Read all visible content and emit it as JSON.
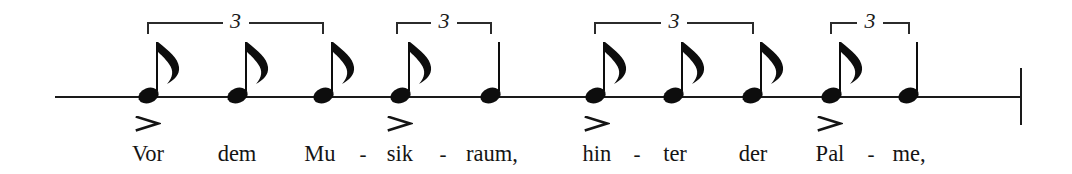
{
  "score": {
    "notation_type": "rhythm-staff",
    "staff": {
      "line_y": 96,
      "line_x_start": 55,
      "line_x_end": 1021,
      "color": "#1a1a1a"
    },
    "barline": {
      "name": "final-barline",
      "x": 1020,
      "y_top": 68,
      "y_bottom": 125
    },
    "tuplets": [
      {
        "number": "3",
        "x_left": 147,
        "x_right": 324,
        "y": 22
      },
      {
        "number": "3",
        "x_left": 396,
        "x_right": 492,
        "y": 22
      },
      {
        "number": "3",
        "x_left": 594,
        "x_right": 754,
        "y": 22
      },
      {
        "number": "3",
        "x_left": 830,
        "x_right": 910,
        "y": 22
      }
    ],
    "notes": [
      {
        "id": "n1",
        "x": 148,
        "duration": "eighth",
        "flag": true,
        "accent": true,
        "syllable": "Vor"
      },
      {
        "id": "n2",
        "x": 237,
        "duration": "eighth",
        "flag": true,
        "accent": false,
        "syllable": "dem"
      },
      {
        "id": "n3",
        "x": 323,
        "duration": "eighth",
        "flag": true,
        "accent": false,
        "syllable": "Mu"
      },
      {
        "id": "n4",
        "x": 400,
        "duration": "eighth",
        "flag": true,
        "accent": true,
        "syllable": "sik"
      },
      {
        "id": "n5",
        "x": 490,
        "duration": "quarter",
        "flag": false,
        "accent": false,
        "syllable": "raum,"
      },
      {
        "id": "n6",
        "x": 595,
        "duration": "eighth",
        "flag": true,
        "accent": true,
        "syllable": "hin"
      },
      {
        "id": "n7",
        "x": 673,
        "duration": "eighth",
        "flag": true,
        "accent": false,
        "syllable": "ter"
      },
      {
        "id": "n8",
        "x": 752,
        "duration": "eighth",
        "flag": true,
        "accent": false,
        "syllable": "der"
      },
      {
        "id": "n9",
        "x": 831,
        "duration": "eighth",
        "flag": true,
        "accent": true,
        "syllable": "Pal"
      },
      {
        "id": "n10",
        "x": 908,
        "duration": "quarter",
        "flag": false,
        "accent": false,
        "syllable": "me,"
      }
    ],
    "lyrics": {
      "text": "Vor dem Mu - sik - raum, hin - ter der Pal - me,",
      "baseline_y": 142,
      "syllables": [
        {
          "text": "Vor",
          "x": 148,
          "accent": true
        },
        {
          "text": "dem",
          "x": 237,
          "accent": false
        },
        {
          "text": "Mu",
          "x": 320,
          "accent": false
        },
        {
          "text": "sik",
          "x": 400,
          "accent": true
        },
        {
          "text": "raum,",
          "x": 492,
          "accent": false
        },
        {
          "text": "hin",
          "x": 597,
          "accent": true
        },
        {
          "text": "ter",
          "x": 675,
          "accent": false
        },
        {
          "text": "der",
          "x": 753,
          "accent": false
        },
        {
          "text": "Pal",
          "x": 830,
          "accent": true
        },
        {
          "text": "me,",
          "x": 909,
          "accent": false
        }
      ],
      "hyphens": [
        {
          "text": "-",
          "x": 363
        },
        {
          "text": "-",
          "x": 443
        },
        {
          "text": "-",
          "x": 637
        },
        {
          "text": "-",
          "x": 871
        }
      ]
    },
    "accents": {
      "glyph": ">",
      "y": 116,
      "marks_over": [
        "Vor",
        "sik",
        "hin",
        "Pal"
      ]
    },
    "colors": {
      "ink": "#141414",
      "staff": "#1a1a1a",
      "background": "#ffffff"
    }
  }
}
